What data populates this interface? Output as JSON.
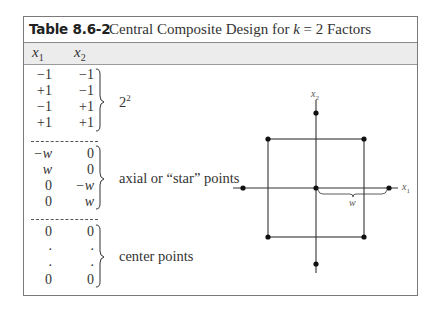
{
  "table": {
    "number": "Table 8.6-2",
    "title_prefix": "Central Composite Design for ",
    "title_var": "k",
    "title_suffix": " = 2 Factors",
    "columns": [
      {
        "var": "x",
        "sub": "1"
      },
      {
        "var": "x",
        "sub": "2"
      }
    ],
    "groups": [
      {
        "label_base": "2",
        "label_sup": "2",
        "rows": [
          [
            "−1",
            "−1"
          ],
          [
            "+1",
            "−1"
          ],
          [
            "−1",
            "+1"
          ],
          [
            "+1",
            "+1"
          ]
        ]
      },
      {
        "label": "axial or “star” points",
        "rows": [
          [
            "−w",
            "0"
          ],
          [
            "w",
            "0"
          ],
          [
            "0",
            "−w"
          ],
          [
            "0",
            "w"
          ]
        ]
      },
      {
        "label": "center points",
        "rows": [
          [
            "0",
            "0"
          ],
          [
            ".",
            "."
          ],
          [
            ".",
            "."
          ],
          [
            "0",
            "0"
          ]
        ]
      }
    ]
  },
  "diagram": {
    "x_axis_label": {
      "var": "x",
      "sub": "1"
    },
    "y_axis_label": {
      "var": "x",
      "sub": "2"
    },
    "distance_label": "w",
    "line_color": "#333333",
    "point_color": "#111111"
  }
}
